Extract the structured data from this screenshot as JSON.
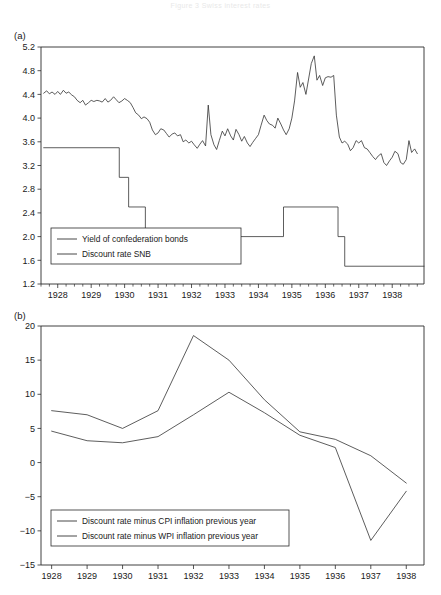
{
  "figure": {
    "header_text": "Figure 3  Swiss interest rates",
    "panel_a_label": "(a)",
    "panel_b_label": "(b)"
  },
  "chart_data": [
    {
      "id": "panel_a",
      "type": "line",
      "title": "",
      "xlabel": "",
      "ylabel": "",
      "xlim": [
        1927.5,
        1938.95
      ],
      "ylim": [
        1.2,
        5.2
      ],
      "ytick_step": 0.4,
      "grid": false,
      "legend_position": "bottom-left",
      "xticks": [
        "1928",
        "1929",
        "1930",
        "1931",
        "1932",
        "1933",
        "1934",
        "1935",
        "1936",
        "1937",
        "1938"
      ],
      "xtick_values": [
        1928,
        1929,
        1930,
        1931,
        1932,
        1933,
        1934,
        1935,
        1936,
        1937,
        1938
      ],
      "x_minor_interval_months": 3,
      "yticks": [
        "1.2",
        "1.6",
        "2.0",
        "2.4",
        "2.8",
        "3.2",
        "3.6",
        "4.0",
        "4.4",
        "4.8",
        "5.2"
      ],
      "ytick_values": [
        1.2,
        1.6,
        2.0,
        2.4,
        2.8,
        3.2,
        3.6,
        4.0,
        4.4,
        4.8,
        5.2
      ],
      "series": [
        {
          "name": "Yield of confederation bonds",
          "color": "#333333",
          "x": [
            1927.58,
            1927.67,
            1927.75,
            1927.83,
            1927.92,
            1928.0,
            1928.08,
            1928.17,
            1928.25,
            1928.33,
            1928.42,
            1928.5,
            1928.58,
            1928.67,
            1928.75,
            1928.83,
            1928.92,
            1929.0,
            1929.08,
            1929.17,
            1929.25,
            1929.33,
            1929.42,
            1929.5,
            1929.58,
            1929.67,
            1929.75,
            1929.83,
            1929.92,
            1930.0,
            1930.08,
            1930.17,
            1930.25,
            1930.33,
            1930.42,
            1930.5,
            1930.58,
            1930.67,
            1930.75,
            1930.83,
            1930.92,
            1931.0,
            1931.08,
            1931.17,
            1931.25,
            1931.33,
            1931.42,
            1931.5,
            1931.58,
            1931.67,
            1931.75,
            1931.83,
            1931.92,
            1932.0,
            1932.08,
            1932.17,
            1932.25,
            1932.33,
            1932.42,
            1932.5,
            1932.58,
            1932.67,
            1932.75,
            1932.83,
            1932.92,
            1933.0,
            1933.08,
            1933.17,
            1933.25,
            1933.33,
            1933.42,
            1933.5,
            1933.58,
            1933.67,
            1933.75,
            1933.83,
            1933.92,
            1934.0,
            1934.08,
            1934.17,
            1934.25,
            1934.33,
            1934.42,
            1934.5,
            1934.58,
            1934.67,
            1934.75,
            1934.83,
            1934.92,
            1935.0,
            1935.08,
            1935.17,
            1935.25,
            1935.33,
            1935.42,
            1935.5,
            1935.58,
            1935.67,
            1935.75,
            1935.83,
            1935.92,
            1936.0,
            1936.08,
            1936.17,
            1936.25,
            1936.33,
            1936.42,
            1936.5,
            1936.58,
            1936.67,
            1936.75,
            1936.83,
            1936.92,
            1937.0,
            1937.08,
            1937.17,
            1937.25,
            1937.33,
            1937.42,
            1937.5,
            1937.58,
            1937.67,
            1937.75,
            1937.83,
            1937.92,
            1938.0,
            1938.08,
            1938.17,
            1938.25,
            1938.33,
            1938.42,
            1938.5,
            1938.58,
            1938.67,
            1938.75,
            1938.83
          ],
          "y": [
            4.42,
            4.46,
            4.41,
            4.44,
            4.4,
            4.45,
            4.4,
            4.47,
            4.42,
            4.44,
            4.39,
            4.36,
            4.3,
            4.26,
            4.3,
            4.22,
            4.26,
            4.3,
            4.28,
            4.3,
            4.29,
            4.27,
            4.33,
            4.27,
            4.3,
            4.36,
            4.31,
            4.26,
            4.29,
            4.33,
            4.3,
            4.26,
            4.18,
            4.09,
            4.05,
            3.99,
            4.02,
            3.99,
            3.93,
            3.8,
            3.72,
            3.75,
            3.82,
            3.8,
            3.74,
            3.68,
            3.73,
            3.75,
            3.7,
            3.72,
            3.6,
            3.63,
            3.58,
            3.61,
            3.55,
            3.49,
            3.56,
            3.62,
            3.53,
            4.22,
            3.72,
            3.55,
            3.47,
            3.62,
            3.78,
            3.7,
            3.82,
            3.7,
            3.63,
            3.81,
            3.72,
            3.61,
            3.69,
            3.58,
            3.52,
            3.59,
            3.66,
            3.72,
            3.88,
            4.05,
            3.96,
            3.9,
            3.88,
            3.83,
            4.0,
            3.9,
            3.8,
            3.72,
            3.82,
            4.0,
            4.29,
            4.77,
            4.52,
            4.6,
            4.4,
            4.66,
            4.92,
            5.05,
            4.64,
            4.72,
            4.55,
            4.68,
            4.7,
            4.69,
            4.72,
            4.05,
            3.68,
            3.58,
            3.61,
            3.56,
            3.45,
            3.5,
            3.62,
            3.58,
            3.62,
            3.5,
            3.48,
            3.42,
            3.35,
            3.3,
            3.36,
            3.4,
            3.25,
            3.2,
            3.28,
            3.34,
            3.44,
            3.4,
            3.25,
            3.22,
            3.3,
            3.62,
            3.42,
            3.48,
            3.4
          ]
        },
        {
          "name": "Discount rate SNB",
          "color": "#333333",
          "step": true,
          "x": [
            1927.58,
            1929.84,
            1929.84,
            1930.12,
            1930.12,
            1930.62,
            1930.62,
            1931.05,
            1931.05,
            1934.75,
            1934.75,
            1936.38,
            1936.38,
            1936.58,
            1936.58,
            1938.95
          ],
          "y": [
            3.5,
            3.5,
            3.0,
            3.0,
            2.5,
            2.5,
            2.0,
            2.0,
            2.0,
            2.0,
            2.5,
            2.5,
            2.0,
            2.0,
            1.5,
            1.5
          ]
        }
      ],
      "legend": [
        "Yield of confederation bonds",
        "Discount rate SNB"
      ]
    },
    {
      "id": "panel_b",
      "type": "line",
      "title": "",
      "xlabel": "",
      "ylabel": "",
      "xlim": [
        1927.7,
        1938.5
      ],
      "ylim": [
        -15,
        20
      ],
      "ytick_step": 5,
      "grid": false,
      "legend_position": "bottom-left",
      "xticks": [
        "1928",
        "1929",
        "1930",
        "1931",
        "1932",
        "1933",
        "1934",
        "1935",
        "1936",
        "1937",
        "1938"
      ],
      "xtick_values": [
        1928,
        1929,
        1930,
        1931,
        1932,
        1933,
        1934,
        1935,
        1936,
        1937,
        1938
      ],
      "yticks": [
        "-15",
        "-10",
        "-5",
        "0",
        "5",
        "10",
        "15",
        "20"
      ],
      "ytick_values": [
        -15,
        -10,
        -5,
        0,
        5,
        10,
        15,
        20
      ],
      "series": [
        {
          "name": "Discount rate minus CPI inflation previous year",
          "color": "#333333",
          "x": [
            1928,
            1929,
            1930,
            1931,
            1932,
            1933,
            1934,
            1935,
            1936,
            1937,
            1938
          ],
          "y": [
            7.6,
            7.0,
            5.0,
            7.6,
            18.6,
            15.0,
            9.2,
            4.5,
            3.4,
            1.0,
            -3.0
          ]
        },
        {
          "name": "Discount rate minus WPI inflation previous year",
          "color": "#333333",
          "x": [
            1928,
            1929,
            1930,
            1931,
            1932,
            1933,
            1934,
            1935,
            1936,
            1937,
            1938
          ],
          "y": [
            4.6,
            3.2,
            2.9,
            3.8,
            7.0,
            10.3,
            7.3,
            4.0,
            2.2,
            -11.4,
            -4.2
          ]
        }
      ],
      "legend": [
        "Discount rate minus CPI inflation previous year",
        "Discount rate minus WPI inflation previous year"
      ]
    }
  ]
}
